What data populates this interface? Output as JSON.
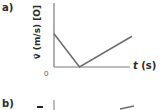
{
  "panels": [
    {
      "label": "a)",
      "y_axis_label": "v⃗ (m/s) [O]",
      "x_axis_var": "t",
      "x_axis_unit": " (s)",
      "origin_label": "0",
      "line_color": "#6e6e6e",
      "axis_color": "#7a7a7a"
    },
    {
      "label": "b)"
    }
  ],
  "chart_data": {
    "type": "line",
    "title": "",
    "xlabel": "t (s)",
    "ylabel": "v⃗ (m/s) [O]",
    "origin_label": "0",
    "grid": false,
    "x_tick_labels": [],
    "y_tick_labels": [],
    "xlim": [
      0,
      1
    ],
    "ylim": [
      0,
      1
    ],
    "note": "Qualitative graph with no numeric ticks; values are normalized to axis extents",
    "series": [
      {
        "name": "velocity",
        "x": [
          0,
          0.34,
          1.04
        ],
        "y": [
          0.52,
          0,
          0.48
        ]
      }
    ]
  }
}
